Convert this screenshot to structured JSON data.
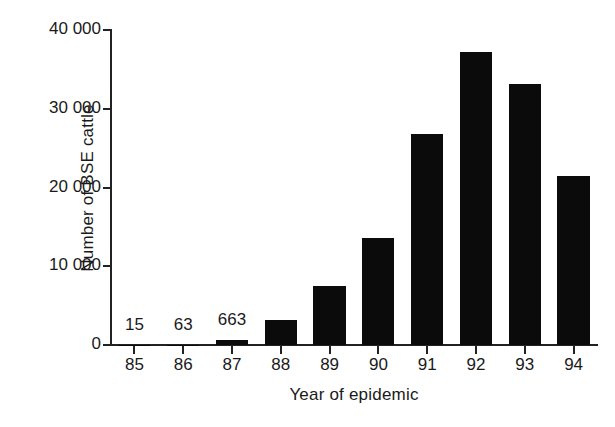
{
  "chart_data": {
    "type": "bar",
    "title": "",
    "xlabel": "Year of epidemic",
    "ylabel": "Number of BSE cattle",
    "categories": [
      "85",
      "86",
      "87",
      "88",
      "89",
      "90",
      "91",
      "92",
      "93",
      "94"
    ],
    "values": [
      15,
      63,
      663,
      3200,
      7500,
      13600,
      26800,
      37200,
      33200,
      21500
    ],
    "point_labels": [
      "15",
      "63",
      "663",
      "",
      "",
      "",
      "",
      "",
      "",
      ""
    ],
    "ylim": [
      0,
      40000
    ],
    "xlim_categories": 10,
    "y_ticks": [
      0,
      10000,
      20000,
      30000,
      40000
    ],
    "y_tick_labels": [
      "0",
      "10 000",
      "20 000",
      "30 000",
      "40 000"
    ],
    "grid": false,
    "legend": null,
    "bar_color": "#0b0b0b",
    "axis_color": "#222222",
    "background_color": "#ffffff"
  },
  "axes": {
    "y_title": "Number of BSE cattle",
    "x_title": "Year of epidemic"
  }
}
